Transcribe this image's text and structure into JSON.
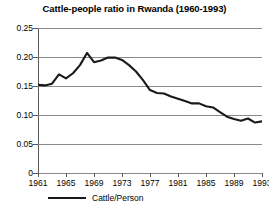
{
  "chart_data": {
    "type": "line",
    "title": "Cattle-people ratio in Rwanda (1960-1993)",
    "xlabel": "",
    "ylabel": "",
    "xlim": [
      1961,
      1993
    ],
    "ylim": [
      0,
      0.25
    ],
    "grid": true,
    "legend_position": "bottom-left",
    "y_ticks": [
      "0.25",
      "0.20",
      "0.15",
      "0.10",
      "0.05",
      "0"
    ],
    "y_tick_values": [
      0.25,
      0.2,
      0.15,
      0.1,
      0.05,
      0
    ],
    "x_ticks": [
      "1961",
      "1965",
      "1969",
      "1973",
      "1977",
      "1981",
      "1985",
      "1989",
      "1993"
    ],
    "x_tick_values": [
      1961,
      1965,
      1969,
      1973,
      1977,
      1981,
      1985,
      1989,
      1993
    ],
    "series": [
      {
        "name": "Cattle/Person",
        "color": "#1a1a1a",
        "x": [
          1961,
          1962,
          1963,
          1964,
          1965,
          1966,
          1967,
          1968,
          1969,
          1970,
          1971,
          1972,
          1973,
          1974,
          1975,
          1976,
          1977,
          1978,
          1979,
          1980,
          1981,
          1982,
          1983,
          1984,
          1985,
          1986,
          1987,
          1988,
          1989,
          1990,
          1991,
          1992,
          1993
        ],
        "values": [
          0.152,
          0.151,
          0.154,
          0.17,
          0.163,
          0.172,
          0.186,
          0.207,
          0.191,
          0.194,
          0.199,
          0.199,
          0.195,
          0.186,
          0.175,
          0.16,
          0.143,
          0.138,
          0.137,
          0.132,
          0.128,
          0.124,
          0.12,
          0.12,
          0.115,
          0.113,
          0.105,
          0.097,
          0.093,
          0.09,
          0.094,
          0.087,
          0.089
        ]
      }
    ]
  },
  "legend": {
    "label": "Cattle/Person"
  }
}
